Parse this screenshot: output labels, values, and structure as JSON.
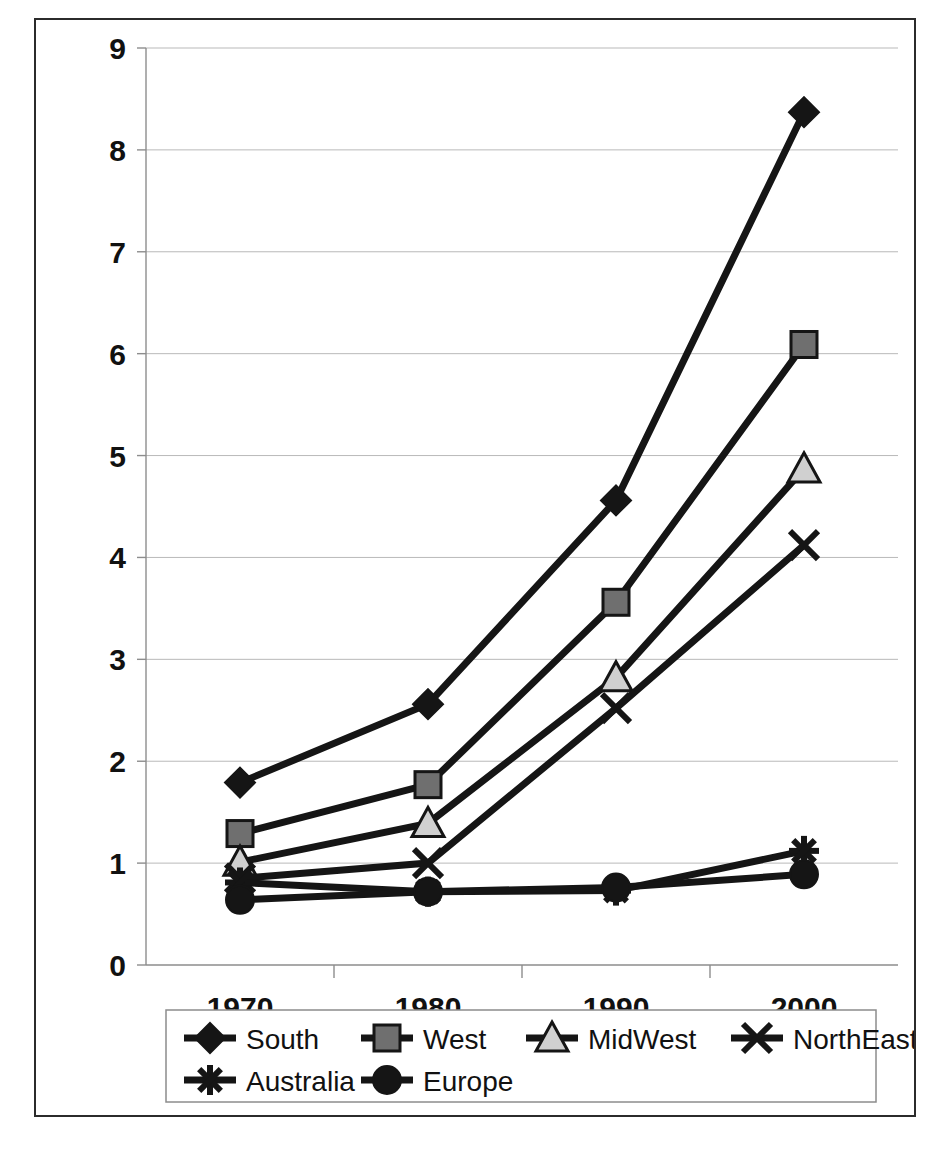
{
  "chart_data": {
    "type": "line",
    "title": "",
    "subtitle": "",
    "xlabel": "",
    "ylabel": "",
    "categories": [
      "1970",
      "1980",
      "1990",
      "2000"
    ],
    "x_tick_labels": [
      "1970",
      "1980",
      "1990",
      "2000"
    ],
    "y_tick_labels": [
      "0",
      "1",
      "2",
      "3",
      "4",
      "5",
      "6",
      "7",
      "8",
      "9"
    ],
    "ylim": [
      0,
      9
    ],
    "y_tick_step": 1,
    "grid": "horizontal",
    "legend_position": "bottom",
    "legend_columns": 4,
    "series": [
      {
        "name": "South",
        "marker": "diamond",
        "marker_fill": "#151515",
        "values": [
          1.79,
          2.56,
          4.56,
          8.37
        ]
      },
      {
        "name": "West",
        "marker": "square",
        "marker_fill": "#6f6f6f",
        "values": [
          1.29,
          1.77,
          3.56,
          6.09
        ]
      },
      {
        "name": "MidWest",
        "marker": "triangle",
        "marker_fill": "#d0d0d0",
        "values": [
          1.01,
          1.39,
          2.82,
          4.87
        ]
      },
      {
        "name": "NorthEast",
        "marker": "x",
        "marker_fill": "#151515",
        "values": [
          0.85,
          1.0,
          2.52,
          4.12
        ]
      },
      {
        "name": "Australia",
        "marker": "asterisk",
        "marker_fill": "#151515",
        "values": [
          0.81,
          0.72,
          0.73,
          1.12
        ]
      },
      {
        "name": "Europe",
        "marker": "circle",
        "marker_fill": "#151515",
        "values": [
          0.64,
          0.72,
          0.76,
          0.89
        ]
      }
    ]
  },
  "legend": {
    "entries": [
      {
        "label": "South"
      },
      {
        "label": "West"
      },
      {
        "label": "MidWest"
      },
      {
        "label": "NorthEast"
      },
      {
        "label": "Australia"
      },
      {
        "label": "Europe"
      }
    ]
  },
  "axes": {
    "y_labels": [
      "9",
      "8",
      "7",
      "6",
      "5",
      "4",
      "3",
      "2",
      "1",
      "0"
    ],
    "x_labels": [
      "1970",
      "1980",
      "1990",
      "2000"
    ]
  },
  "colors": {
    "line": "#151515",
    "grid": "#b9b9b9",
    "frame": "#2b2b2b",
    "marker_dark": "#151515",
    "marker_grey": "#6f6f6f",
    "marker_light": "#d0d0d0",
    "background": "#ffffff"
  }
}
